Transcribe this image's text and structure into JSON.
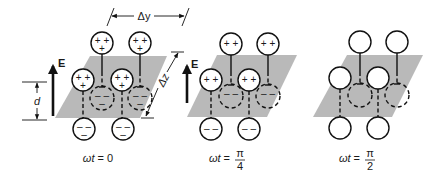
{
  "figure": {
    "field_label": "E",
    "separation_label": "d",
    "dimension_labels": {
      "dy": "Δy",
      "dz": "Δz"
    },
    "panels": [
      {
        "id": "phase-0",
        "omega_t": "ωt",
        "equals": "=",
        "value": "0",
        "fraction": null,
        "upper_charge_signs": [
          "+ +",
          "+"
        ],
        "lower_charge_signs": [
          "– –",
          "–"
        ],
        "show_field_arrow": true,
        "show_dimensions": true
      },
      {
        "id": "phase-pi-4",
        "omega_t": "ωt",
        "equals": "=",
        "value": null,
        "fraction": {
          "numerator": "π",
          "denominator": "4"
        },
        "upper_charge_signs": [
          "+ +",
          ""
        ],
        "lower_charge_signs": [
          "– –",
          ""
        ],
        "show_field_arrow": true,
        "show_dimensions": false
      },
      {
        "id": "phase-pi-2",
        "omega_t": "ωt",
        "equals": "=",
        "value": null,
        "fraction": {
          "numerator": "π",
          "denominator": "2"
        },
        "upper_charge_signs": [
          "",
          ""
        ],
        "lower_charge_signs": [
          "",
          ""
        ],
        "show_field_arrow": false,
        "show_dimensions": false
      }
    ]
  }
}
